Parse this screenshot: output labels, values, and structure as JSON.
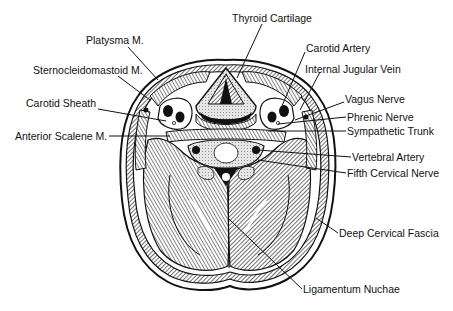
{
  "figure": {
    "colors": {
      "ink": "#111111",
      "background": "#ffffff",
      "fill_light": "#d8d8d8",
      "fill_dark": "#222222"
    }
  },
  "labels": [
    {
      "id": "thyroid-cartilage",
      "text": "Thyroid Cartilage",
      "x": 232,
      "y": 12
    },
    {
      "id": "platysma",
      "text": "Platysma M.",
      "x": 86,
      "y": 34
    },
    {
      "id": "carotid-artery",
      "text": "Carotid Artery",
      "x": 306,
      "y": 42
    },
    {
      "id": "sternocleidomastoid",
      "text": "Sternocleidomastoid M.",
      "x": 33,
      "y": 64
    },
    {
      "id": "internal-jugular-vein",
      "text": "Internal Jugular Vein",
      "x": 305,
      "y": 63
    },
    {
      "id": "carotid-sheath",
      "text": "Carotid Sheath",
      "x": 26,
      "y": 97
    },
    {
      "id": "vagus-nerve",
      "text": "Vagus Nerve",
      "x": 345,
      "y": 93
    },
    {
      "id": "phrenic-nerve",
      "text": "Phrenic Nerve",
      "x": 347,
      "y": 111
    },
    {
      "id": "anterior-scalene",
      "text": "Anterior Scalene M.",
      "x": 15,
      "y": 128
    },
    {
      "id": "sympathetic-trunk",
      "text": "Sympathetic Trunk",
      "x": 347,
      "y": 125
    },
    {
      "id": "vertebral-artery",
      "text": "Vertebral Artery",
      "x": 352,
      "y": 151
    },
    {
      "id": "fifth-cervical-nerve",
      "text": "Fifth Cervical Nerve",
      "x": 347,
      "y": 167
    },
    {
      "id": "deep-cervical-fascia",
      "text": "Deep Cervical Fascia",
      "x": 339,
      "y": 227
    },
    {
      "id": "ligamentum-nuchae",
      "text": "Ligamentum Nuchae",
      "x": 303,
      "y": 287
    }
  ]
}
